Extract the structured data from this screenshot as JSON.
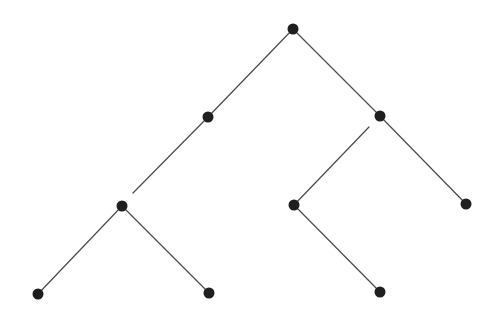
{
  "diagram": {
    "type": "binary-tree",
    "style": {
      "node_color": "#1f1f1f",
      "edge_color": "#4a4a4a",
      "node_radius": 5.5,
      "background": "#ffffff"
    },
    "nodes": [
      {
        "id": "root",
        "x": 293,
        "y": 29
      },
      {
        "id": "L",
        "x": 208,
        "y": 117
      },
      {
        "id": "R",
        "x": 380,
        "y": 116
      },
      {
        "id": "LL",
        "x": 122,
        "y": 206
      },
      {
        "id": "RL",
        "x": 294,
        "y": 205
      },
      {
        "id": "RR",
        "x": 466,
        "y": 204
      },
      {
        "id": "LLL",
        "x": 38,
        "y": 294
      },
      {
        "id": "LLR",
        "x": 209,
        "y": 293
      },
      {
        "id": "RLR",
        "x": 380,
        "y": 292
      }
    ],
    "edges": [
      {
        "from": "root",
        "to": "L",
        "x1": 293,
        "y1": 29,
        "x2": 208,
        "y2": 117
      },
      {
        "from": "root",
        "to": "R",
        "x1": 293,
        "y1": 29,
        "x2": 380,
        "y2": 116
      },
      {
        "from": "L",
        "to": "LL",
        "x1": 208,
        "y1": 117,
        "x2": 133,
        "y2": 193,
        "gap_near": "LL"
      },
      {
        "from": "R",
        "to": "RL",
        "x1": 369,
        "y1": 127,
        "x2": 294,
        "y2": 205,
        "gap_near": "R"
      },
      {
        "from": "R",
        "to": "RR",
        "x1": 380,
        "y1": 116,
        "x2": 466,
        "y2": 204
      },
      {
        "from": "LL",
        "to": "LLL",
        "x1": 122,
        "y1": 206,
        "x2": 38,
        "y2": 294
      },
      {
        "from": "LL",
        "to": "LLR",
        "x1": 122,
        "y1": 206,
        "x2": 209,
        "y2": 293
      },
      {
        "from": "RL",
        "to": "RLR",
        "x1": 294,
        "y1": 205,
        "x2": 380,
        "y2": 292
      }
    ]
  }
}
